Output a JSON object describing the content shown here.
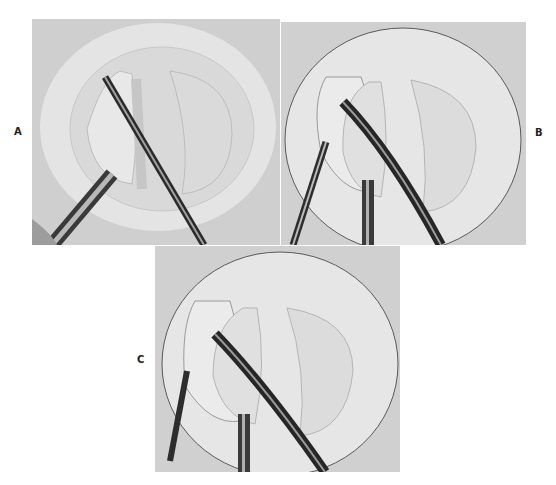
{
  "figure": {
    "panels": [
      {
        "id": "A",
        "label": "A",
        "description": "Arthroscopic view of meniscal tissue with grasping forceps and probe instrument"
      },
      {
        "id": "B",
        "label": "B",
        "description": "Arthroscopic view with curved instrument and grasping forceps resecting meniscal edge"
      },
      {
        "id": "C",
        "label": "C",
        "description": "Arthroscopic view with curved instrument, suction tube and forceps after resection"
      }
    ],
    "colors": {
      "background": "#ffffff",
      "photo_base": "#d4d4d4",
      "ring": "#e6e6e6",
      "tissue": "#cfcfcf",
      "instrument_dark": "#2a2a2a",
      "instrument_light": "#9a9a9a"
    }
  }
}
